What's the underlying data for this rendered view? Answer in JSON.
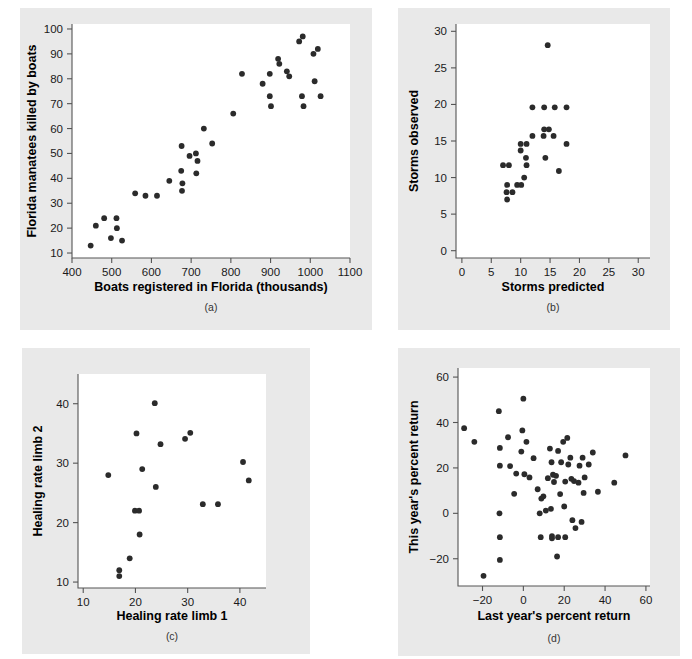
{
  "figure": {
    "background_color": "#ffffff",
    "panel_background_color": "#e9e9e9",
    "plot_area_color": "#ffffff",
    "point_color": "#2b2b2b",
    "axis_color": "#555555"
  },
  "chart_data": [
    {
      "id": "a",
      "type": "scatter",
      "title": "",
      "caption": "(a)",
      "xlabel": "Boats registered in Florida (thousands)",
      "ylabel": "Florida manatees killed by boats",
      "xlim": [
        400,
        1100
      ],
      "ylim": [
        8,
        102
      ],
      "xticks": [
        400,
        500,
        600,
        700,
        800,
        900,
        1000,
        1100
      ],
      "xticklabels": [
        "400",
        "500",
        "600",
        "700",
        "800",
        "900",
        "1000",
        "1100"
      ],
      "yticks": [
        10,
        20,
        30,
        40,
        50,
        60,
        70,
        80,
        90,
        100
      ],
      "yticklabels": [
        "10",
        "20",
        "30",
        "40",
        "50",
        "60",
        "70",
        "80",
        "90",
        "100"
      ],
      "grid": false,
      "legend": null,
      "points": [
        [
          447,
          13
        ],
        [
          460,
          21
        ],
        [
          481,
          24
        ],
        [
          498,
          16
        ],
        [
          513,
          20
        ],
        [
          512,
          24
        ],
        [
          526,
          15
        ],
        [
          559,
          34
        ],
        [
          585,
          33
        ],
        [
          614,
          33
        ],
        [
          645,
          39
        ],
        [
          675,
          43
        ],
        [
          676,
          53
        ],
        [
          678,
          38
        ],
        [
          677,
          35
        ],
        [
          696,
          49
        ],
        [
          712,
          50
        ],
        [
          713,
          42
        ],
        [
          716,
          47
        ],
        [
          753,
          54
        ],
        [
          732,
          60
        ],
        [
          806,
          66
        ],
        [
          828,
          82
        ],
        [
          880,
          78
        ],
        [
          898,
          82
        ],
        [
          898,
          73
        ],
        [
          901,
          69
        ],
        [
          919,
          88
        ],
        [
          922,
          86
        ],
        [
          941,
          83
        ],
        [
          947,
          81
        ],
        [
          972,
          95
        ],
        [
          981,
          97
        ],
        [
          979,
          73
        ],
        [
          983,
          69
        ],
        [
          1008,
          90
        ],
        [
          1011,
          79
        ],
        [
          1019,
          92
        ],
        [
          1026,
          73
        ]
      ]
    },
    {
      "id": "b",
      "type": "scatter",
      "title": "",
      "caption": "(b)",
      "xlabel": "Storms predicted",
      "ylabel": "Storms observed",
      "xlim": [
        -1,
        32
      ],
      "ylim": [
        -1,
        31
      ],
      "xticks": [
        0,
        5,
        10,
        15,
        20,
        25,
        30
      ],
      "xticklabels": [
        "0",
        "5",
        "10",
        "15",
        "20",
        "25",
        "30"
      ],
      "yticks": [
        0,
        5,
        10,
        15,
        20,
        25,
        30
      ],
      "yticklabels": [
        "0",
        "5",
        "10",
        "15",
        "20",
        "25",
        "30"
      ],
      "grid": false,
      "legend": null,
      "points": [
        [
          7.0,
          11.7
        ],
        [
          8.0,
          11.7
        ],
        [
          7.7,
          9.0
        ],
        [
          7.6,
          8.0
        ],
        [
          7.7,
          7.0
        ],
        [
          8.6,
          8.0
        ],
        [
          9.4,
          9.0
        ],
        [
          10.1,
          9.0
        ],
        [
          10.0,
          14.6
        ],
        [
          10.0,
          13.7
        ],
        [
          10.6,
          10.0
        ],
        [
          11.0,
          14.6
        ],
        [
          10.9,
          12.7
        ],
        [
          11.0,
          11.7
        ],
        [
          12.0,
          19.6
        ],
        [
          12.0,
          15.7
        ],
        [
          14.0,
          19.6
        ],
        [
          14.0,
          16.6
        ],
        [
          14.2,
          12.7
        ],
        [
          13.9,
          15.7
        ],
        [
          14.8,
          16.6
        ],
        [
          14.6,
          28.1
        ],
        [
          15.8,
          19.6
        ],
        [
          15.6,
          15.7
        ],
        [
          16.5,
          10.9
        ],
        [
          17.8,
          19.6
        ],
        [
          17.8,
          14.6
        ]
      ]
    },
    {
      "id": "c",
      "type": "scatter",
      "title": "",
      "caption": "(c)",
      "xlabel": "Healing rate limb 1",
      "ylabel": "Healing rate limb 2",
      "xlim": [
        9,
        45
      ],
      "ylim": [
        9,
        45
      ],
      "xticks": [
        10,
        20,
        30,
        40
      ],
      "xticklabels": [
        "10",
        "20",
        "30",
        "40"
      ],
      "yticks": [
        10,
        20,
        30,
        40
      ],
      "yticklabels": [
        "10",
        "20",
        "30",
        "40"
      ],
      "grid": false,
      "legend": null,
      "points": [
        [
          14.8,
          28.0
        ],
        [
          16.9,
          12.0
        ],
        [
          16.9,
          11.0
        ],
        [
          18.9,
          14.0
        ],
        [
          19.9,
          22.0
        ],
        [
          20.7,
          22.0
        ],
        [
          20.2,
          35.0
        ],
        [
          20.8,
          18.0
        ],
        [
          21.3,
          29.0
        ],
        [
          23.7,
          40.1
        ],
        [
          23.9,
          26.0
        ],
        [
          24.8,
          33.2
        ],
        [
          29.5,
          34.1
        ],
        [
          30.5,
          35.1
        ],
        [
          32.9,
          23.1
        ],
        [
          35.8,
          23.1
        ],
        [
          40.6,
          30.2
        ],
        [
          41.7,
          27.1
        ]
      ]
    },
    {
      "id": "d",
      "type": "scatter",
      "title": "",
      "caption": "(d)",
      "xlabel": "Last year's percent return",
      "ylabel": "This year's percent return",
      "xlim": [
        -32,
        62
      ],
      "ylim": [
        -32,
        64
      ],
      "xticks": [
        -20,
        0,
        20,
        40,
        60
      ],
      "xticklabels": [
        "−20",
        "0",
        "20",
        "40",
        "60"
      ],
      "yticks": [
        -20,
        0,
        20,
        40,
        60
      ],
      "yticklabels": [
        "−20",
        "0",
        "20",
        "40",
        "60"
      ],
      "grid": false,
      "legend": null,
      "points": [
        [
          -29.0,
          37.5
        ],
        [
          -24.0,
          31.5
        ],
        [
          -19.5,
          -27.5
        ],
        [
          -12.0,
          45.0
        ],
        [
          -11.5,
          28.8
        ],
        [
          -11.5,
          21.0
        ],
        [
          -11.7,
          0.0
        ],
        [
          -11.5,
          -10.5
        ],
        [
          -11.5,
          -20.5
        ],
        [
          -7.5,
          33.5
        ],
        [
          -6.5,
          20.8
        ],
        [
          -4.5,
          8.6
        ],
        [
          -3.5,
          17.5
        ],
        [
          -1.0,
          27.2
        ],
        [
          -0.5,
          36.5
        ],
        [
          0.0,
          50.5
        ],
        [
          0.5,
          17.2
        ],
        [
          1.5,
          31.5
        ],
        [
          3.0,
          15.8
        ],
        [
          5.0,
          24.3
        ],
        [
          7.0,
          10.6
        ],
        [
          8.0,
          0.0
        ],
        [
          8.5,
          -10.5
        ],
        [
          8.8,
          6.5
        ],
        [
          9.8,
          7.5
        ],
        [
          11.0,
          1.2
        ],
        [
          12.0,
          15.5
        ],
        [
          13.0,
          28.5
        ],
        [
          13.5,
          2.0
        ],
        [
          13.8,
          22.5
        ],
        [
          14.0,
          -10.0
        ],
        [
          14.0,
          -11.0
        ],
        [
          14.5,
          17.0
        ],
        [
          15.0,
          13.8
        ],
        [
          16.0,
          16.5
        ],
        [
          16.5,
          -19.0
        ],
        [
          17.0,
          27.5
        ],
        [
          17.0,
          -10.5
        ],
        [
          18.0,
          8.5
        ],
        [
          18.5,
          22.5
        ],
        [
          19.5,
          31.5
        ],
        [
          20.0,
          3.0
        ],
        [
          20.5,
          14.0
        ],
        [
          20.5,
          -10.5
        ],
        [
          21.5,
          33.2
        ],
        [
          22.0,
          21.5
        ],
        [
          23.0,
          24.5
        ],
        [
          23.5,
          15.2
        ],
        [
          24.0,
          -3.0
        ],
        [
          24.8,
          14.2
        ],
        [
          25.5,
          -6.5
        ],
        [
          27.0,
          13.5
        ],
        [
          27.5,
          21.0
        ],
        [
          28.5,
          -3.8
        ],
        [
          29.0,
          24.5
        ],
        [
          29.5,
          9.0
        ],
        [
          30.0,
          15.8
        ],
        [
          32.0,
          21.5
        ],
        [
          34.0,
          26.8
        ],
        [
          36.5,
          9.5
        ],
        [
          44.5,
          13.5
        ],
        [
          50.0,
          25.5
        ]
      ]
    }
  ]
}
